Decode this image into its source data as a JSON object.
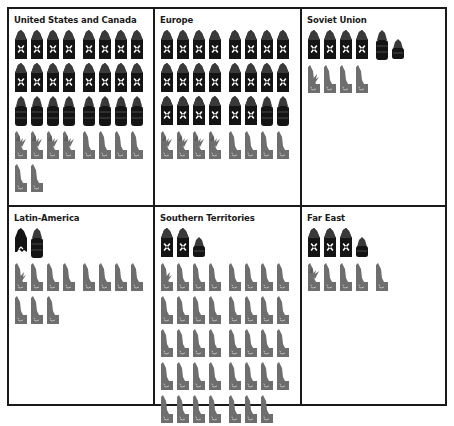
{
  "chart_data": {
    "type": "table",
    "title": "",
    "legend": [
      {
        "symbol": "factory",
        "meaning": "industrial production (black sack with crossed tools)"
      },
      {
        "symbol": "barrel",
        "meaning": "raw materials / oil (black barrel)"
      },
      {
        "symbol": "mixed",
        "meaning": "mixed industrial-agricultural (grey, with plant)"
      },
      {
        "symbol": "agri",
        "meaning": "agricultural production (grey seat-shaped)"
      }
    ],
    "regions": [
      {
        "name": "United States and Canada",
        "factory": 16,
        "barrel": 8,
        "mixed": 4,
        "agri": 6
      },
      {
        "name": "Europe",
        "factory": 22,
        "barrel": 2,
        "mixed": 4,
        "agri": 4
      },
      {
        "name": "Soviet Union",
        "factory": 4,
        "barrel": 1.5,
        "mixed": 1,
        "agri": 3
      },
      {
        "name": "Latin-America",
        "factory": 0.5,
        "barrel": 1,
        "mixed": 1,
        "agri": 10
      },
      {
        "name": "Southern Territories",
        "factory": 2,
        "barrel": 0.5,
        "mixed": 1,
        "agri": 38
      },
      {
        "name": "Far East",
        "factory": 3,
        "barrel": 0.5,
        "mixed": 1,
        "agri": 4
      }
    ]
  },
  "colors": {
    "black": "#141414",
    "grey": "#6e6e6e",
    "border": "#1a1a1a"
  },
  "cells": [
    {
      "title": "United States and Canada",
      "rows": [
        [
          "factory",
          "factory",
          "factory",
          "factory",
          "factory",
          "factory",
          "factory",
          "factory"
        ],
        [
          "factory",
          "factory",
          "factory",
          "factory",
          "factory",
          "factory",
          "factory",
          "factory"
        ],
        [
          "barrel",
          "barrel",
          "barrel",
          "barrel",
          "barrel",
          "barrel",
          "barrel",
          "barrel"
        ],
        [
          "mixed",
          "mixed",
          "mixed",
          "mixed",
          "agri",
          "agri",
          "agri",
          "agri"
        ],
        [
          "agri",
          "agri"
        ]
      ]
    },
    {
      "title": "Europe",
      "rows": [
        [
          "factory",
          "factory",
          "factory",
          "factory",
          "factory",
          "factory",
          "factory",
          "factory"
        ],
        [
          "factory",
          "factory",
          "factory",
          "factory",
          "factory",
          "factory",
          "factory",
          "factory"
        ],
        [
          "factory",
          "factory",
          "factory",
          "factory",
          "factory",
          "factory",
          "barrel",
          "barrel"
        ],
        [
          "mixed",
          "mixed",
          "mixed",
          "mixed",
          "agri",
          "agri",
          "agri",
          "agri"
        ]
      ]
    },
    {
      "title": "Soviet Union",
      "rows": [
        [
          "factory",
          "factory",
          "factory",
          "factory",
          "barrel",
          "half-barrel"
        ],
        [
          "mixed-partial",
          "agri",
          "agri",
          "agri"
        ]
      ]
    },
    {
      "title": "Latin-America",
      "rows": [
        [
          "half-factory",
          "barrel"
        ],
        [
          "mixed-partial",
          "agri",
          "agri",
          "agri",
          "agri",
          "agri",
          "agri",
          "agri"
        ],
        [
          "agri",
          "agri",
          "agri"
        ]
      ]
    },
    {
      "title": "Southern Territories",
      "rows": [
        [
          "factory",
          "factory",
          "half-barrel"
        ],
        [
          "mixed-partial",
          "agri",
          "agri",
          "agri",
          "agri",
          "agri",
          "agri",
          "agri"
        ],
        [
          "agri",
          "agri",
          "agri",
          "agri",
          "agri",
          "agri",
          "agri",
          "agri"
        ],
        [
          "agri",
          "agri",
          "agri",
          "agri",
          "agri",
          "agri",
          "agri",
          "agri"
        ],
        [
          "agri",
          "agri",
          "agri",
          "agri",
          "agri",
          "agri",
          "agri",
          "agri"
        ],
        [
          "agri",
          "agri",
          "agri",
          "agri",
          "agri",
          "agri",
          "agri"
        ]
      ]
    },
    {
      "title": "Far East",
      "rows": [
        [
          "factory",
          "factory",
          "factory",
          "half-barrel"
        ],
        [
          "mixed",
          "agri",
          "agri",
          "agri",
          "agri"
        ]
      ]
    }
  ]
}
